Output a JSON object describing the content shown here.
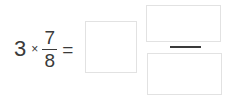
{
  "problem": {
    "type": "fraction-multiplication",
    "whole_number": "3",
    "operator": "×",
    "fraction": {
      "numerator": "7",
      "denominator": "8"
    },
    "equals": "=",
    "answer_fields": {
      "whole_part": {
        "value": "",
        "placeholder": ""
      },
      "fraction_numerator": {
        "value": "",
        "placeholder": ""
      },
      "fraction_denominator": {
        "value": "",
        "placeholder": ""
      }
    }
  },
  "colors": {
    "background": "#ffffff",
    "text": "#3a3a3a",
    "box_border": "#e2e2e2",
    "fraction_bar": "#3a3a3a"
  }
}
